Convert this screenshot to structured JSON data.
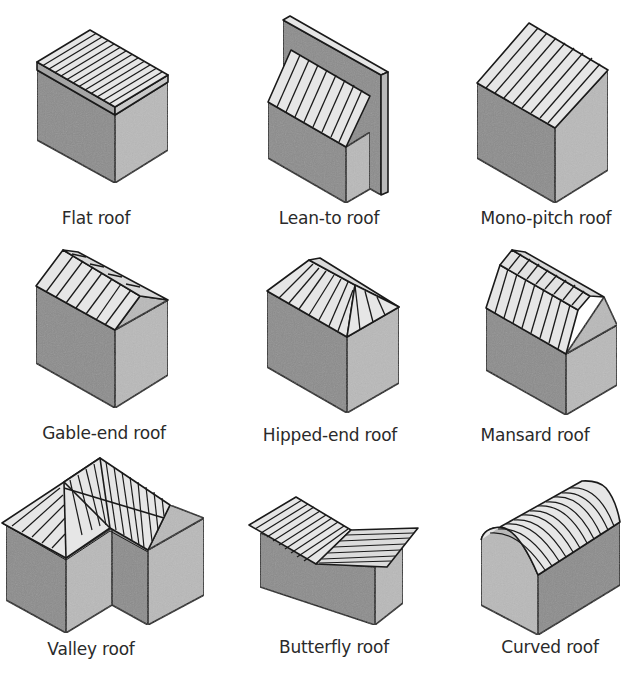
{
  "colors": {
    "background": "#ffffff",
    "outline": "#1a1a1a",
    "wall_dark": "#8c8c8c",
    "wall_light": "#b9b9b9",
    "roof": "#e6e6e6",
    "text": "#2a2a2a"
  },
  "roofs": [
    {
      "id": "flat",
      "label": "Flat roof"
    },
    {
      "id": "lean-to",
      "label": "Lean-to roof"
    },
    {
      "id": "mono-pitch",
      "label": "Mono-pitch roof"
    },
    {
      "id": "gable-end",
      "label": "Gable-end roof"
    },
    {
      "id": "hipped-end",
      "label": "Hipped-end roof"
    },
    {
      "id": "mansard",
      "label": "Mansard roof"
    },
    {
      "id": "valley",
      "label": "Valley roof"
    },
    {
      "id": "butterfly",
      "label": "Butterfly roof"
    },
    {
      "id": "curved",
      "label": "Curved roof"
    }
  ]
}
